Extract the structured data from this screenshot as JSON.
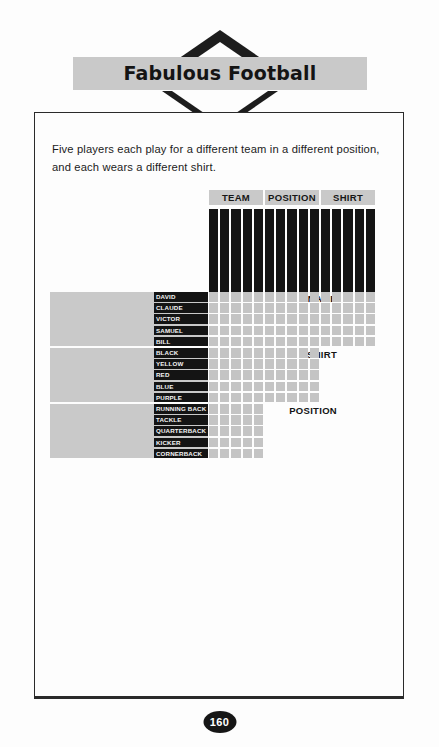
{
  "page": {
    "title": "Fabulous Football",
    "number": "160",
    "intro": "Five players each play for a different team in a different position, and each wears a different shirt."
  },
  "grid": {
    "column_categories": [
      {
        "label": "TEAM",
        "count": 5
      },
      {
        "label": "POSITION",
        "count": 5
      },
      {
        "label": "SHIRT",
        "count": 5
      }
    ],
    "column_labels": [
      "CAROLINA PANTHERS",
      "DALLAS COWBOYS",
      "GREEN BAY PACKERS",
      "BUFFALO BILLS",
      "CLEVELAND BROWNS",
      "RUNNING BACK",
      "TACKLE",
      "QUARTERBACK",
      "KICKER",
      "CORNERBACK",
      "BLACK",
      "YELLOW",
      "RED",
      "BLUE",
      "PURPLE"
    ],
    "row_blocks": [
      {
        "category": "NAME",
        "rows": [
          "DAVID",
          "CLAUDE",
          "VICTOR",
          "SAMUEL",
          "BILL"
        ],
        "columns": 15
      },
      {
        "category": "SHIRT",
        "rows": [
          "BLACK",
          "YELLOW",
          "RED",
          "BLUE",
          "PURPLE"
        ],
        "columns": 10
      },
      {
        "category": "POSITION",
        "rows": [
          "RUNNING BACK",
          "TACKLE",
          "QUARTERBACK",
          "KICKER",
          "CORNERBACK"
        ],
        "columns": 5
      }
    ]
  },
  "colors": {
    "banner": "#c9c9c9",
    "label_block": "#141414",
    "cell": "#c4c4c4",
    "border": "#2a2a2a",
    "page_number_bg": "#161616"
  }
}
